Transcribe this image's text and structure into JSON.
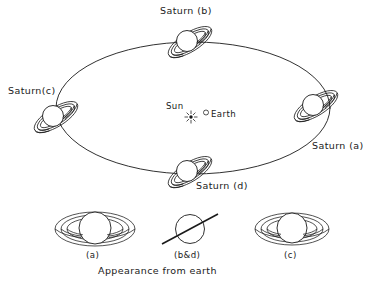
{
  "figure": {
    "caption": "Appearance from earth",
    "background_color": "#ffffff",
    "ink_color": "#1a1a1a"
  },
  "orbit": {
    "name": "saturn-orbit-ellipse",
    "center_x": 193,
    "center_y": 108,
    "radius_x": 137,
    "radius_y": 66
  },
  "center_objects": {
    "sun": {
      "label": "Sun",
      "icon": "sun-starburst-icon",
      "x": 191,
      "y": 117
    },
    "earth": {
      "label": "Earth",
      "icon": "earth-circle-icon",
      "x": 206,
      "y": 113
    }
  },
  "orbit_positions": [
    {
      "id": "a",
      "label": "Saturn (a)",
      "planet_x": 316,
      "planet_y": 106,
      "label_x": 312,
      "label_y": 141,
      "ring_tilt_deg": -32,
      "description": "rings wide open, right of orbit"
    },
    {
      "id": "b",
      "label": "Saturn (b)",
      "planet_x": 190,
      "planet_y": 42,
      "label_x": 160,
      "label_y": 6,
      "ring_tilt_deg": -32,
      "description": "rings edge-on as seen from earth, top of orbit"
    },
    {
      "id": "c",
      "label": "Saturn(c)",
      "planet_x": 56,
      "planet_y": 117,
      "label_x": 8,
      "label_y": 86,
      "ring_tilt_deg": -32,
      "description": "rings wide open, left of orbit"
    },
    {
      "id": "d",
      "label": "Saturn (d)",
      "planet_x": 190,
      "planet_y": 172,
      "label_x": 196,
      "label_y": 181,
      "ring_tilt_deg": -32,
      "description": "rings edge-on as seen from earth, bottom of orbit"
    }
  ],
  "appearance_row": {
    "caption": "Appearance from earth",
    "caption_x": 98,
    "caption_y": 268,
    "items": [
      {
        "id": "a",
        "label": "(a)",
        "center_x": 95,
        "center_y": 229,
        "label_x": 86,
        "label_y": 255,
        "view": "rings-open",
        "ring_count": 3
      },
      {
        "id": "bd",
        "label": "(b&d)",
        "center_x": 190,
        "center_y": 229,
        "label_x": 175,
        "label_y": 255,
        "view": "rings-edge-on",
        "ring_count": 0
      },
      {
        "id": "c",
        "label": "(c)",
        "center_x": 292,
        "center_y": 229,
        "label_x": 284,
        "label_y": 255,
        "view": "rings-open",
        "ring_count": 3
      }
    ]
  }
}
